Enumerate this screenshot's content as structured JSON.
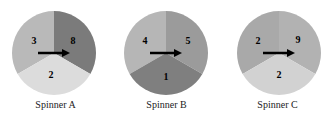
{
  "spinners": [
    {
      "label": "Spinner A",
      "sectors": [
        {
          "position": "left",
          "number": "3",
          "color": "#b9b9b9"
        },
        {
          "position": "right",
          "number": "8",
          "color": "#7b7b7b"
        },
        {
          "position": "bottom",
          "number": "2",
          "color": "#dcdcdc"
        }
      ]
    },
    {
      "label": "Spinner B",
      "sectors": [
        {
          "position": "left",
          "number": "4",
          "color": "#b6b6b6"
        },
        {
          "position": "right",
          "number": "5",
          "color": "#9b9b9b"
        },
        {
          "position": "bottom",
          "number": "1",
          "color": "#7f7f7f"
        }
      ]
    },
    {
      "label": "Spinner C",
      "sectors": [
        {
          "position": "left",
          "number": "2",
          "color": "#a9a9a9"
        },
        {
          "position": "right",
          "number": "9",
          "color": "#b2b2b2"
        },
        {
          "position": "bottom",
          "number": "2",
          "color": "#d2d2d2"
        }
      ]
    }
  ],
  "arrow_color": "#000000"
}
